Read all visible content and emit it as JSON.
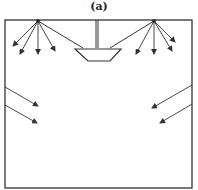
{
  "figure": {
    "label": "(a)",
    "stroke_color": "#333333",
    "background": "#ffffff"
  },
  "room": {
    "box": {
      "x1": 5,
      "y1": 20,
      "x2": 192,
      "y2": 188
    }
  },
  "ceiling_lights": [
    {
      "name": "left-light-source",
      "origin": [
        38,
        21
      ],
      "arrows": [
        [
          13,
          46
        ],
        [
          20,
          54
        ],
        [
          38,
          54
        ],
        [
          55,
          51
        ]
      ],
      "support_line_to": [
        83,
        48
      ]
    },
    {
      "name": "right-light-source",
      "origin": [
        154,
        21
      ],
      "arrows": [
        [
          136,
          54
        ],
        [
          154,
          54
        ],
        [
          172,
          51
        ],
        [
          175,
          42
        ]
      ],
      "support_line_to": [
        110,
        48
      ]
    }
  ],
  "pendant": {
    "rod": {
      "x": 97,
      "y1": 20,
      "y2": 48
    },
    "bowl": [
      [
        75,
        49
      ],
      [
        121,
        49
      ],
      [
        110,
        61
      ],
      [
        88,
        61
      ]
    ]
  },
  "wall_rays": {
    "left": [
      {
        "from": [
          5,
          87
        ],
        "to": [
          38,
          106
        ]
      },
      {
        "from": [
          5,
          105
        ],
        "to": [
          37,
          123
        ]
      }
    ],
    "right": [
      {
        "from": [
          192,
          85
        ],
        "to": [
          152,
          108
        ]
      },
      {
        "from": [
          192,
          104
        ],
        "to": [
          160,
          123
        ]
      }
    ]
  }
}
